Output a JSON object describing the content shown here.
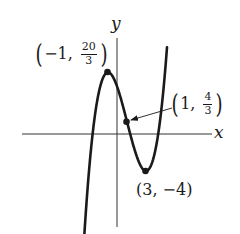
{
  "diagram": {
    "function": "f(x) = x^3/3 - x^2 - 3x + 5",
    "axes": {
      "x_label": "x",
      "y_label": "y"
    },
    "points": [
      {
        "name": "local-maximum",
        "x": -1,
        "y": "20/3",
        "x_text": "−1,",
        "num": "20",
        "den": "3"
      },
      {
        "name": "inflection-point",
        "x": 1,
        "y": "4/3",
        "x_text": "1,",
        "num": "4",
        "den": "3"
      },
      {
        "name": "local-minimum",
        "x": 3,
        "y": -4,
        "text": "(3, −4)"
      }
    ],
    "colors": {
      "curve": "#1a1a1a",
      "axes": "#333333",
      "background": "#ffffff"
    }
  },
  "chart_data": {
    "type": "line",
    "title": "",
    "xlabel": "x",
    "ylabel": "y",
    "series": [
      {
        "name": "f(x) = x^3/3 - x^2 - 3x + 5",
        "x": [
          -3.5,
          -3,
          -2.5,
          -2,
          -1.5,
          -1,
          -0.5,
          0,
          0.5,
          1,
          1.5,
          2,
          2.5,
          3,
          3.5,
          4,
          4.5,
          5,
          5.2
        ],
        "values": [
          -11.04,
          -4.0,
          0.79,
          3.33,
          4.25,
          6.67,
          6.21,
          5.0,
          3.29,
          1.33,
          -0.63,
          -2.33,
          -3.54,
          -4.0,
          -3.46,
          -1.67,
          1.63,
          6.67,
          9.19
        ]
      }
    ],
    "annotations": [
      {
        "x": -1,
        "y": 6.667,
        "label": "(−1, 20/3)"
      },
      {
        "x": 1,
        "y": 1.333,
        "label": "(1, 4/3)",
        "arrow": true
      },
      {
        "x": 3,
        "y": -4,
        "label": "(3, −4)"
      }
    ],
    "grid": false,
    "legend": "none"
  }
}
